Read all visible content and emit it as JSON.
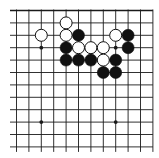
{
  "board": {
    "type": "go-diagram",
    "background": "#ffffff",
    "line_color": "#1a1a1a",
    "columns": 12,
    "rows": 12,
    "origin_x": 16.5,
    "origin_y": 10.5,
    "spacing_x": 12.4,
    "spacing_y": 12.4,
    "top_edge": true,
    "left_edge": false,
    "right_edge": false,
    "bottom_edge": false,
    "star_points": [
      {
        "col": 2,
        "row": 3
      },
      {
        "col": 8,
        "row": 3
      },
      {
        "col": 2,
        "row": 9
      },
      {
        "col": 8,
        "row": 9
      }
    ],
    "stones": [
      {
        "color": "white",
        "col": 4,
        "row": 1
      },
      {
        "color": "white",
        "col": 2,
        "row": 2
      },
      {
        "color": "white",
        "col": 4,
        "row": 2
      },
      {
        "color": "black",
        "col": 5,
        "row": 2
      },
      {
        "color": "white",
        "col": 8,
        "row": 2
      },
      {
        "color": "black",
        "col": 9,
        "row": 2
      },
      {
        "color": "black",
        "col": 4,
        "row": 3
      },
      {
        "color": "white",
        "col": 5,
        "row": 3
      },
      {
        "color": "white",
        "col": 6,
        "row": 3
      },
      {
        "color": "white",
        "col": 7,
        "row": 3
      },
      {
        "color": "black",
        "col": 9,
        "row": 3
      },
      {
        "color": "black",
        "col": 4,
        "row": 4
      },
      {
        "color": "black",
        "col": 5,
        "row": 4
      },
      {
        "color": "black",
        "col": 6,
        "row": 4
      },
      {
        "color": "white",
        "col": 7,
        "row": 4
      },
      {
        "color": "black",
        "col": 8,
        "row": 4
      },
      {
        "color": "black",
        "col": 7,
        "row": 5
      },
      {
        "color": "black",
        "col": 8,
        "row": 5
      }
    ],
    "stone_colors": {
      "black": "#111111",
      "white": "#ffffff"
    }
  }
}
